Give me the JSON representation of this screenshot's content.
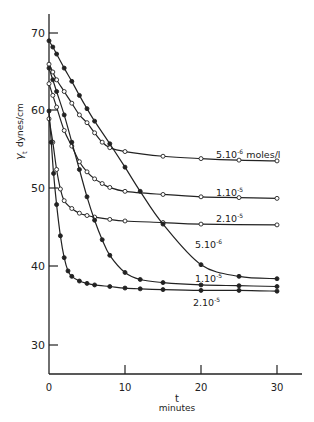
{
  "chart_data": {
    "type": "line",
    "title": "",
    "xlabel": "t",
    "xlabel_sub": "minutes",
    "ylabel": "γt dynes/cm",
    "xlim": [
      0,
      32
    ],
    "ylim": [
      25,
      72
    ],
    "xticks": [
      0,
      10,
      20,
      30
    ],
    "yticks": [
      30,
      40,
      50,
      60,
      70
    ],
    "grid": false,
    "series": [
      {
        "name": "5.10^-6 moles/l",
        "marker": "open",
        "label": "5.10⁻⁶ moles/l",
        "x": [
          0,
          0.5,
          1,
          2,
          3,
          4,
          5,
          6,
          7,
          8,
          10,
          15,
          20,
          25,
          30
        ],
        "y": [
          66,
          65,
          64,
          62.5,
          61,
          59.5,
          58.5,
          57.2,
          56,
          55.3,
          54.8,
          54.2,
          53.9,
          53.7,
          53.6
        ]
      },
      {
        "name": "1.10^-5 (open)",
        "marker": "open",
        "label": "1.10⁻⁵",
        "x": [
          0,
          0.5,
          1,
          2,
          3,
          4,
          5,
          6,
          7,
          8,
          10,
          15,
          20,
          25,
          30
        ],
        "y": [
          63.5,
          62,
          60.5,
          57.5,
          55.5,
          53.5,
          52.2,
          51.3,
          50.7,
          50.2,
          49.7,
          49.3,
          49.0,
          48.9,
          48.8
        ],
        "note": "open circles"
      },
      {
        "name": "2.10^-5 (open)",
        "marker": "open",
        "label": "2.10⁻⁵",
        "x": [
          0,
          0.5,
          1,
          1.5,
          2,
          3,
          4,
          5,
          6,
          8,
          10,
          15,
          20,
          30
        ],
        "y": [
          59,
          56,
          52.5,
          50,
          48.5,
          47.5,
          46.9,
          46.6,
          46.4,
          46.1,
          45.9,
          45.7,
          45.5,
          45.4
        ]
      },
      {
        "name": "5.10^-6 (filled)",
        "marker": "filled",
        "label": "5.10⁻⁶",
        "x": [
          0,
          0.5,
          1,
          2,
          3,
          4,
          5,
          6,
          8,
          10,
          12,
          15,
          20,
          25,
          30
        ],
        "y": [
          69,
          68.2,
          67.3,
          65.5,
          63.8,
          62,
          60.3,
          58.7,
          55.8,
          52.8,
          49.7,
          45.5,
          40.3,
          38.8,
          38.5
        ]
      },
      {
        "name": "1.10^-5 (filled)",
        "marker": "filled",
        "label": "1.10⁻⁵",
        "x": [
          0,
          0.5,
          1,
          2,
          3,
          4,
          5,
          6,
          7,
          8,
          10,
          12,
          15,
          20,
          25,
          30
        ],
        "y": [
          65.5,
          64,
          62.5,
          59.5,
          56,
          52.5,
          49,
          46,
          43.5,
          41.5,
          39.3,
          38.4,
          38,
          37.7,
          37.6,
          37.5
        ]
      },
      {
        "name": "2.10^-5 (filled)",
        "marker": "filled",
        "label": "2.10⁻⁵",
        "x": [
          0,
          0.3,
          0.6,
          1,
          1.5,
          2,
          2.5,
          3,
          4,
          5,
          6,
          8,
          10,
          12,
          15,
          20,
          25,
          30
        ],
        "y": [
          60,
          56,
          52,
          48,
          44,
          41.2,
          39.5,
          38.8,
          38.2,
          37.9,
          37.7,
          37.5,
          37.3,
          37.2,
          37.1,
          37.0,
          37.0,
          36.9
        ]
      }
    ]
  },
  "labels": {
    "open_5e6": "5.10",
    "open_5e6_exp": "-6",
    "open_5e6_unit": "moles/l",
    "open_1e5": "1.10",
    "open_1e5_exp": "-5",
    "open_2e5": "2.10",
    "open_2e5_exp": "-5",
    "filled_5e6": "5.10",
    "filled_5e6_exp": "-6",
    "filled_1e5": "1.10",
    "filled_1e5_exp": "-5",
    "filled_2e5": "2.10",
    "filled_2e5_exp": "-5",
    "ylabel_gamma": "γ",
    "ylabel_sub": "t",
    "ylabel_units": "dynes/cm",
    "xlabel": "t",
    "xlabel_units": "minutes",
    "xtick_0": "0",
    "xtick_10": "10",
    "xtick_20": "20",
    "xtick_30": "30",
    "ytick_30": "30",
    "ytick_40": "40",
    "ytick_50": "50",
    "ytick_60": "60",
    "ytick_70": "70"
  }
}
